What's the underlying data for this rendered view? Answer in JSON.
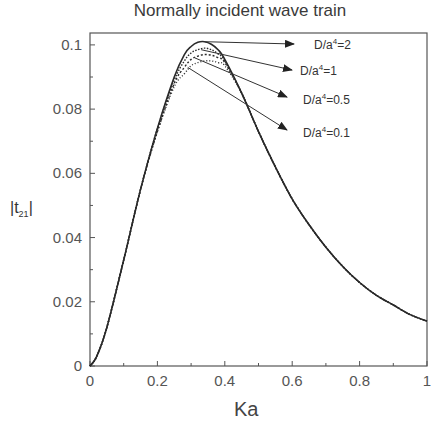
{
  "chart_data": {
    "type": "line",
    "title": "Normally incident wave train",
    "xlabel": "Ka",
    "ylabel": "|t₂₁|",
    "xlim": [
      0,
      1
    ],
    "ylim": [
      0,
      0.105
    ],
    "xticks": [
      "0",
      "0.2",
      "0.4",
      "0.6",
      "0.8",
      "1"
    ],
    "yticks": [
      "0",
      "0.02",
      "0.04",
      "0.06",
      "0.08",
      "0.1"
    ],
    "grid": false,
    "legend_position": "annotations with arrows, upper right",
    "x": [
      0,
      0.02,
      0.05,
      0.1,
      0.15,
      0.2,
      0.25,
      0.28,
      0.3,
      0.32,
      0.34,
      0.36,
      0.38,
      0.4,
      0.45,
      0.5,
      0.55,
      0.6,
      0.65,
      0.7,
      0.75,
      0.8,
      0.85,
      0.9,
      0.95,
      1.0
    ],
    "series": [
      {
        "name": "D/a⁴=2",
        "values": [
          0,
          0.003,
          0.012,
          0.033,
          0.055,
          0.074,
          0.09,
          0.097,
          0.0995,
          0.1008,
          0.101,
          0.1002,
          0.0985,
          0.0955,
          0.085,
          0.073,
          0.062,
          0.052,
          0.044,
          0.037,
          0.031,
          0.026,
          0.022,
          0.019,
          0.016,
          0.014
        ]
      },
      {
        "name": "D/a⁴=1",
        "values": [
          0,
          0.003,
          0.012,
          0.033,
          0.055,
          0.074,
          0.089,
          0.095,
          0.0975,
          0.0985,
          0.099,
          0.0985,
          0.0972,
          0.095,
          0.085,
          0.073,
          0.062,
          0.052,
          0.044,
          0.037,
          0.031,
          0.026,
          0.022,
          0.019,
          0.016,
          0.014
        ]
      },
      {
        "name": "D/a⁴=0.5",
        "values": [
          0,
          0.003,
          0.012,
          0.033,
          0.055,
          0.073,
          0.088,
          0.093,
          0.0955,
          0.0965,
          0.097,
          0.0968,
          0.096,
          0.0945,
          0.085,
          0.073,
          0.062,
          0.052,
          0.044,
          0.037,
          0.031,
          0.026,
          0.022,
          0.019,
          0.016,
          0.014
        ]
      },
      {
        "name": "D/a⁴=0.1",
        "values": [
          0,
          0.003,
          0.012,
          0.033,
          0.055,
          0.073,
          0.087,
          0.091,
          0.0935,
          0.0945,
          0.095,
          0.095,
          0.0945,
          0.0935,
          0.085,
          0.073,
          0.062,
          0.052,
          0.044,
          0.037,
          0.031,
          0.026,
          0.022,
          0.019,
          0.016,
          0.014
        ]
      }
    ],
    "annotations": [
      {
        "text": "D/a⁴=2",
        "arrow_from": [
          0.34,
          0.101
        ]
      },
      {
        "text": "D/a⁴=1",
        "arrow_from": [
          0.33,
          0.0985
        ]
      },
      {
        "text": "D/a⁴=0.5",
        "arrow_from": [
          0.31,
          0.096
        ]
      },
      {
        "text": "D/a⁴=0.1",
        "arrow_from": [
          0.29,
          0.093
        ]
      }
    ]
  },
  "labels": {
    "title": "Normally incident wave train",
    "xlabel": "Ka",
    "ylabel_main": "|t",
    "ylabel_sub": "21",
    "ylabel_end": "|",
    "legend": [
      {
        "base": "D/a",
        "sup": "4",
        "val": "=2"
      },
      {
        "base": "D/a",
        "sup": "4",
        "val": "=1"
      },
      {
        "base": "D/a",
        "sup": "4",
        "val": "=0.5"
      },
      {
        "base": "D/a",
        "sup": "4",
        "val": "=0.1"
      }
    ]
  }
}
